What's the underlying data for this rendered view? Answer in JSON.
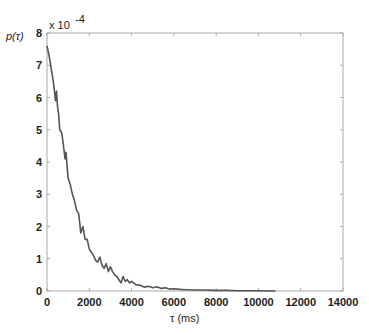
{
  "chart_data": {
    "type": "line",
    "title": "",
    "ylabel": "p(τ)",
    "xlabel": "τ  (ms)",
    "y_exponent_label": "x 10",
    "y_exponent_power": "-4",
    "xlim": [
      0,
      14000
    ],
    "ylim": [
      0,
      8
    ],
    "y_scale": 0.0001,
    "grid": false,
    "legend": null,
    "x_ticks": [
      "0",
      "2000",
      "4000",
      "6000",
      "8000",
      "10000",
      "12000",
      "14000"
    ],
    "y_ticks": [
      "0",
      "1",
      "2",
      "3",
      "4",
      "5",
      "6",
      "7",
      "8"
    ],
    "series": [
      {
        "name": "p(τ)",
        "color": "#555555",
        "x": [
          0,
          100,
          200,
          300,
          400,
          450,
          500,
          550,
          600,
          700,
          800,
          850,
          900,
          1000,
          1100,
          1200,
          1300,
          1400,
          1500,
          1600,
          1700,
          1800,
          1900,
          2000,
          2100,
          2200,
          2300,
          2400,
          2500,
          2600,
          2700,
          2800,
          2900,
          3000,
          3100,
          3200,
          3300,
          3400,
          3500,
          3600,
          3700,
          3800,
          3900,
          4000,
          4200,
          4400,
          4600,
          4800,
          5000,
          5200,
          5400,
          5600,
          5800,
          6000,
          6300,
          6600,
          7000,
          7500,
          8000,
          8500,
          9000,
          9500,
          10000,
          10800
        ],
        "values": [
          7.6,
          7.3,
          6.9,
          6.5,
          5.9,
          6.2,
          5.7,
          5.5,
          5.0,
          4.9,
          4.4,
          4.1,
          4.3,
          3.5,
          3.3,
          3.0,
          2.8,
          2.5,
          2.4,
          1.8,
          2.0,
          1.6,
          1.6,
          1.3,
          1.2,
          1.1,
          0.95,
          0.9,
          1.05,
          0.8,
          0.7,
          0.85,
          0.6,
          0.75,
          0.6,
          0.5,
          0.45,
          0.35,
          0.25,
          0.45,
          0.3,
          0.35,
          0.25,
          0.3,
          0.2,
          0.18,
          0.12,
          0.15,
          0.1,
          0.13,
          0.08,
          0.1,
          0.06,
          0.07,
          0.05,
          0.04,
          0.03,
          0.03,
          0.02,
          0.02,
          0.01,
          0.01,
          0.01,
          0.0
        ]
      }
    ]
  },
  "plot": {
    "left": 47,
    "right": 343,
    "top": 33,
    "bottom": 291,
    "axis_color": "#aaaaaa",
    "line_color": "#555555"
  }
}
